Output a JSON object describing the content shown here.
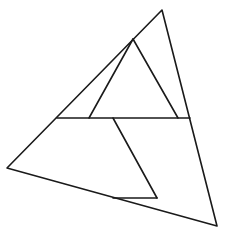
{
  "diagram": {
    "title": "",
    "stroke_color": "#1a1a1a",
    "background": "#ffffff",
    "vertices": {
      "top": [
        162,
        10
      ],
      "left": [
        7,
        168
      ],
      "bottom_right": [
        217,
        226
      ],
      "inner_apex": [
        133,
        39
      ],
      "mid_left": [
        57,
        118
      ],
      "mid_right": [
        190,
        118
      ],
      "inner_base_left": [
        89,
        118
      ],
      "inner_base_right": [
        178,
        118
      ],
      "branch_top": [
        113,
        118
      ],
      "branch_tip": [
        157,
        198
      ],
      "branch_base": [
        113,
        198
      ]
    },
    "segments": [
      {
        "id": "outer-top-left",
        "from": "top",
        "to": "left"
      },
      {
        "id": "outer-top-right",
        "from": "top",
        "to": "bottom_right"
      },
      {
        "id": "outer-bottom",
        "from": "left",
        "to": "bottom_right"
      },
      {
        "id": "horizontal-chord",
        "from": "mid_left",
        "to": "mid_right"
      },
      {
        "id": "inner-left",
        "from": "inner_apex",
        "to": "inner_base_left"
      },
      {
        "id": "inner-right",
        "from": "inner_apex",
        "to": "inner_base_right"
      },
      {
        "id": "branch-diagonal",
        "from": "branch_top",
        "to": "branch_tip"
      },
      {
        "id": "branch-horizontal",
        "from": "branch_base",
        "to": "branch_tip"
      }
    ]
  }
}
